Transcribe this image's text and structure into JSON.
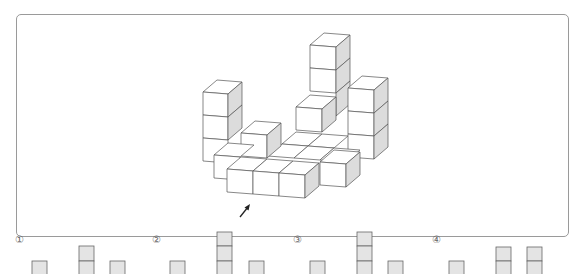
{
  "question_marker": "·",
  "figure": {
    "arrow_direction": "front-left, pointing up-right",
    "side_face_color": "#dcdcdc",
    "frame_color": "#9a9a9a"
  },
  "options": [
    {
      "label": "①",
      "columns": [
        1,
        2,
        1
      ]
    },
    {
      "label": "②",
      "columns": [
        1,
        3,
        1
      ]
    },
    {
      "label": "③",
      "columns": [
        1,
        3,
        1
      ]
    },
    {
      "label": "④",
      "columns": [
        1,
        2,
        2
      ]
    }
  ],
  "colors": {
    "square_fill": "#e4e4e4",
    "square_stroke": "#666666",
    "label": "#666666"
  }
}
